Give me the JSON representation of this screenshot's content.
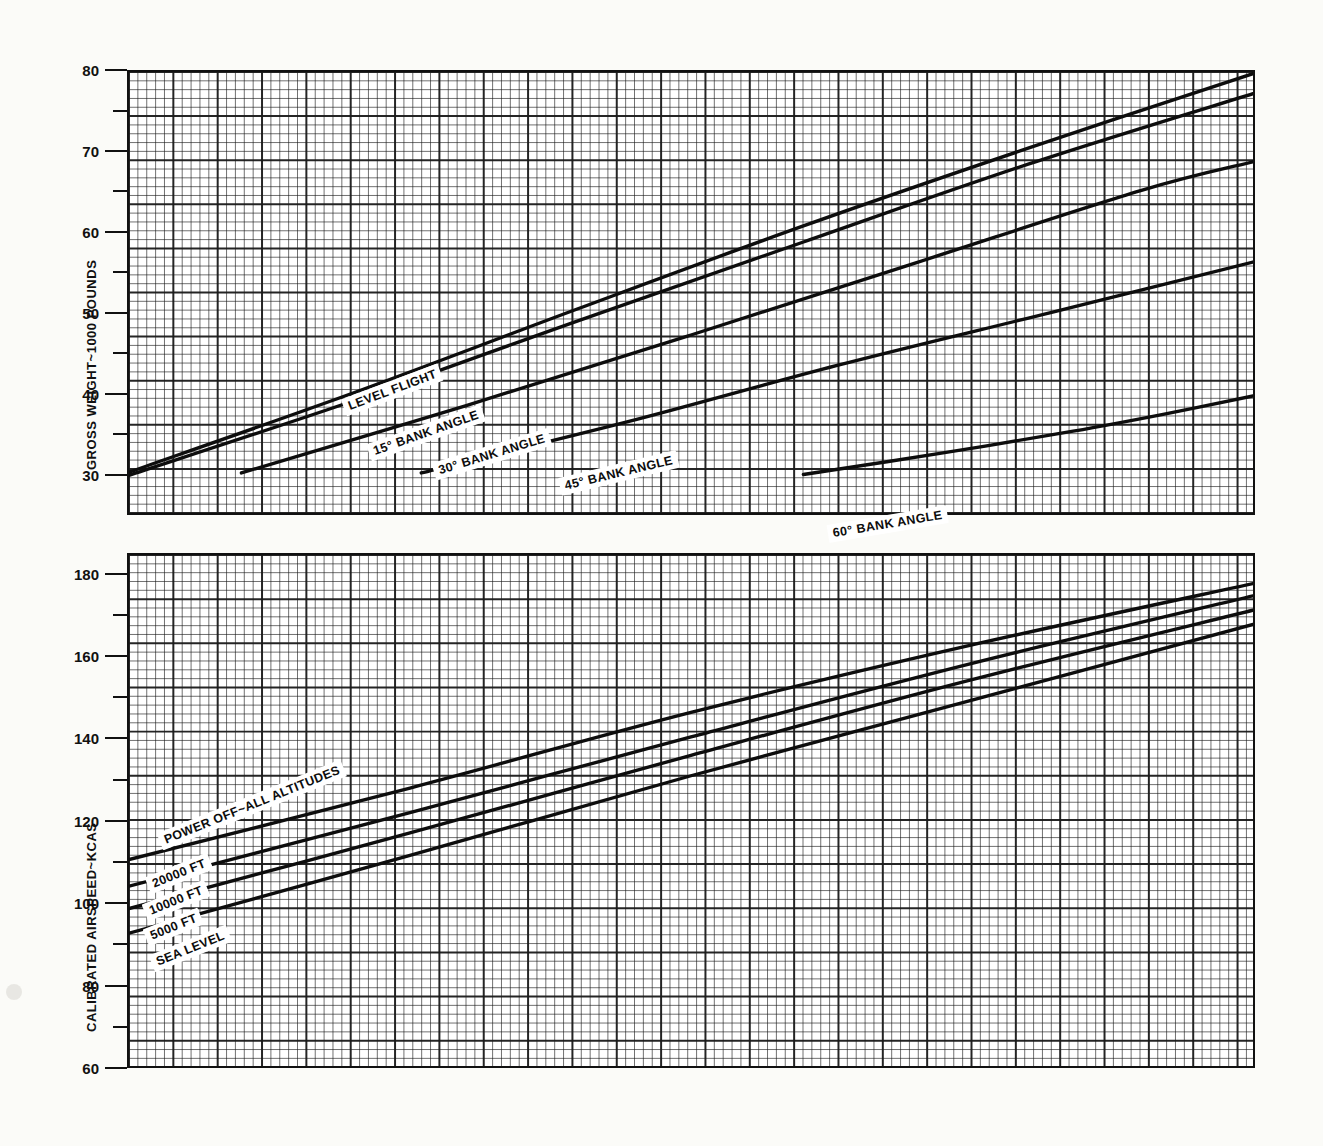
{
  "figure": {
    "background_color": "#fdfdfb",
    "ink_color": "#0d0d0d"
  },
  "upper_panel": {
    "y_axis_title": "GROSS WEIGHT~1000 POUNDS",
    "y_ticks_major": [
      "30",
      "40",
      "50",
      "60",
      "70",
      "80"
    ],
    "curve_labels": [
      "LEVEL FLIGHT",
      "15° BANK ANGLE",
      "30° BANK ANGLE",
      "45° BANK ANGLE",
      "60° BANK ANGLE"
    ]
  },
  "lower_panel": {
    "y_axis_title": "CALIBRATED AIRSPEED~KCAS",
    "y_ticks_major": [
      "60",
      "80",
      "100",
      "120",
      "140",
      "160",
      "180"
    ],
    "curve_labels": [
      "POWER OFF~ALL ALTITUDES",
      "20000 FT",
      "10000 FT",
      "5000 FT",
      "SEA LEVEL"
    ]
  },
  "chart_data": {
    "type": "line",
    "title": "",
    "subtitle": "",
    "panels": [
      {
        "name": "upper",
        "ylabel": "GROSS WEIGHT~1000 POUNDS",
        "xlabel": "",
        "ylim": [
          25,
          80
        ],
        "ytick_major": [
          30,
          40,
          50,
          60,
          70,
          80
        ],
        "ytick_minor": [
          35,
          45,
          55,
          65,
          75
        ],
        "grid": true,
        "xlim": [
          0,
          100
        ],
        "series": [
          {
            "name": "LEVEL FLIGHT",
            "label": "LEVEL FLIGHT",
            "x": [
              0,
              20,
              40,
              60,
              80,
              100
            ],
            "values": [
              30.1,
              40.0,
              50.5,
              60.8,
              70.5,
              79.8
            ]
          },
          {
            "name": "15 DEG BANK ANGLE",
            "label": "15° BANK ANGLE",
            "x": [
              0,
              20,
              40,
              60,
              80,
              100
            ],
            "values": [
              29.7,
              39.0,
              49.0,
              58.8,
              68.5,
              77.3
            ]
          },
          {
            "name": "30 DEG BANK ANGLE",
            "label": "30° BANK ANGLE",
            "x": [
              10,
              30,
              50,
              70,
              90,
              100
            ],
            "values": [
              30.0,
              38.4,
              47.2,
              56.2,
              65.2,
              68.8
            ]
          },
          {
            "name": "45 DEG BANK ANGLE",
            "label": "45° BANK ANGLE",
            "x": [
              26,
              45,
              63,
              82,
              100
            ],
            "values": [
              30.0,
              36.6,
              43.4,
              50.0,
              56.3
            ]
          },
          {
            "name": "60 DEG BANK ANGLE",
            "label": "60° BANK ANGLE",
            "x": [
              60,
              72,
              84,
              92,
              100
            ],
            "values": [
              29.8,
              32.4,
              35.2,
              37.3,
              39.6
            ]
          }
        ]
      },
      {
        "name": "lower",
        "ylabel": "CALIBRATED AIRSPEED~KCAS",
        "xlabel": "",
        "ylim": [
          60,
          185
        ],
        "ytick_major": [
          60,
          80,
          100,
          120,
          140,
          160,
          180
        ],
        "ytick_minor": [
          70,
          90,
          110,
          130,
          150,
          170
        ],
        "grid": true,
        "xlim": [
          0,
          100
        ],
        "annotation": "POWER OFF~ALL ALTITUDES",
        "series": [
          {
            "name": "20000 FT",
            "label": "20000 FT",
            "x": [
              0,
              25,
              50,
              75,
              100
            ],
            "values": [
              110.5,
              128.0,
              146.5,
              163.0,
              178.0
            ]
          },
          {
            "name": "10000 FT",
            "label": "10000 FT",
            "x": [
              0,
              25,
              50,
              75,
              100
            ],
            "values": [
              104.0,
              122.0,
              140.5,
              158.5,
              175.0
            ]
          },
          {
            "name": "5000 FT",
            "label": "5000 FT",
            "x": [
              0,
              25,
              50,
              75,
              100
            ],
            "values": [
              98.5,
              117.0,
              136.0,
              154.5,
              171.5
            ]
          },
          {
            "name": "SEA LEVEL",
            "label": "SEA LEVEL",
            "x": [
              0,
              25,
              50,
              75,
              100
            ],
            "values": [
              92.5,
              111.5,
              131.0,
              149.5,
              168.0
            ]
          }
        ]
      }
    ]
  }
}
